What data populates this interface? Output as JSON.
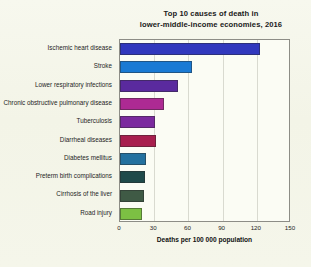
{
  "chart_data": {
    "type": "bar",
    "orientation": "horizontal",
    "title": "Top 10 causes of death in lower-middle-income economies, 2016",
    "title_lines": [
      "Top 10 causes of death in",
      "lower-middle-income economies, 2016"
    ],
    "xlabel": "Deaths per 100 000 population",
    "ylabel": "",
    "xlim": [
      0,
      150
    ],
    "xticks": [
      0,
      30,
      60,
      90,
      120,
      150
    ],
    "xtick_labels": [
      "0",
      "30",
      "60",
      "90",
      "120",
      "150"
    ],
    "grid": true,
    "grid_axis": "x",
    "legend": false,
    "categories": [
      "Ischemic heart disease",
      "Stroke",
      "Lower respiratory infections",
      "Chronic obstructive pulmonary disease",
      "Tuberculosis",
      "Diarrheal diseases",
      "Diabetes mellitus",
      "Preterm birth complications",
      "Cirrhosis of the liver",
      "Road injury"
    ],
    "values": [
      123,
      63,
      51,
      39,
      31,
      32,
      23,
      22,
      21,
      19
    ],
    "colors": [
      "#3138bd",
      "#1a7ad4",
      "#5a2a9e",
      "#ad2a93",
      "#7b2a9e",
      "#a81f4e",
      "#24719f",
      "#1f4a4a",
      "#3f5a45",
      "#7cc043"
    ],
    "bars": [
      {
        "label": "Ischemic heart disease",
        "value": 123,
        "color": "#3138bd"
      },
      {
        "label": "Stroke",
        "value": 63,
        "color": "#1a7ad4"
      },
      {
        "label": "Lower respiratory infections",
        "value": 51,
        "color": "#5a2a9e"
      },
      {
        "label": "Chronic obstructive pulmonary disease",
        "value": 39,
        "color": "#ad2a93"
      },
      {
        "label": "Tuberculosis",
        "value": 31,
        "color": "#7b2a9e"
      },
      {
        "label": "Diarrheal diseases",
        "value": 32,
        "color": "#a81f4e"
      },
      {
        "label": "Diabetes mellitus",
        "value": 23,
        "color": "#24719f"
      },
      {
        "label": "Preterm birth complications",
        "value": 22,
        "color": "#1f4a4a"
      },
      {
        "label": "Cirrhosis of the liver",
        "value": 21,
        "color": "#3f5a45"
      },
      {
        "label": "Road injury",
        "value": 19,
        "color": "#7cc043"
      }
    ]
  },
  "style": {
    "background": "#f4f5e9",
    "plot_background": "#fbfcf4",
    "axis_color": "#8d8d86",
    "grid_color": "#d9dad0",
    "text_color": "#1a1a1a"
  }
}
